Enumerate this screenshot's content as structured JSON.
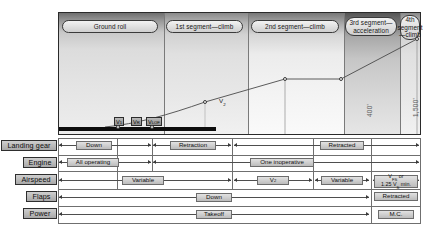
{
  "diagram": {
    "segments": [
      {
        "id": "ground-roll",
        "label": "Ground roll",
        "x": 1,
        "w": 104,
        "shade": "p-light"
      },
      {
        "id": "first-segment",
        "label": "1st segment—climb",
        "x": 105,
        "w": 84,
        "shade": "p-mid"
      },
      {
        "id": "second-segment",
        "label": "2nd segment—climb",
        "x": 189,
        "w": 96,
        "shade": "p-white"
      },
      {
        "id": "third-segment",
        "label": "3rd segment—acceleration",
        "x": 285,
        "w": 56,
        "shade": "p-dark"
      },
      {
        "id": "fourth-segment",
        "label": "4th segment—climb",
        "x": 341,
        "w": 21,
        "shade": "p-mid"
      }
    ],
    "altitudes": [
      {
        "id": "alt-400",
        "label": "400'"
      },
      {
        "id": "alt-1500",
        "label": "1,500'"
      }
    ],
    "speeds": [
      {
        "id": "v1",
        "main": "V",
        "sub": "1"
      },
      {
        "id": "vr",
        "main": "V",
        "sub": "R"
      },
      {
        "id": "vlof",
        "main": "V",
        "sub": "LOF"
      }
    ],
    "v2_marker": {
      "main": "V",
      "sub": "2"
    }
  },
  "table": {
    "rows": [
      {
        "id": "landing-gear",
        "label": "Landing gear",
        "cells": [
          {
            "id": "gear-down",
            "text": "Down"
          },
          {
            "id": "gear-retraction",
            "text": "Retraction"
          },
          {
            "id": "gear-retracted",
            "text": "Retracted"
          }
        ]
      },
      {
        "id": "engine",
        "label": "Engine",
        "cells": [
          {
            "id": "engine-all-operating",
            "text": "All operating"
          },
          {
            "id": "engine-one-inoperative",
            "text": "One inoperative"
          }
        ]
      },
      {
        "id": "airspeed",
        "label": "Airspeed",
        "cells": [
          {
            "id": "airspeed-variable-1",
            "text": "Variable"
          },
          {
            "id": "airspeed-v2",
            "text": "V2",
            "main": "V",
            "sub": "2"
          },
          {
            "id": "airspeed-variable-2",
            "text": "Variable"
          },
          {
            "id": "airspeed-vfs",
            "text": "VFS or 1.25 VS min.",
            "line1_main": "V",
            "line1_sub": "FS",
            "line1_tail": " or",
            "line2_pre": "1.25 ",
            "line2_main": "V",
            "line2_sub": "S",
            "line2_tail": " min."
          }
        ]
      },
      {
        "id": "flaps",
        "label": "Flaps",
        "cells": [
          {
            "id": "flaps-down",
            "text": "Down"
          },
          {
            "id": "flaps-retracted",
            "text": "Retracted"
          }
        ]
      },
      {
        "id": "power",
        "label": "Power",
        "cells": [
          {
            "id": "power-takeoff",
            "text": "Takeoff"
          },
          {
            "id": "power-mc",
            "text": "M.C."
          }
        ]
      }
    ]
  },
  "colors": {
    "border": "#2a2a2a",
    "rule": "#6f6f6f",
    "runway": "#0d0d0d",
    "label_fill": "#b8b8b8",
    "alt_text": "#5a5a5a"
  }
}
